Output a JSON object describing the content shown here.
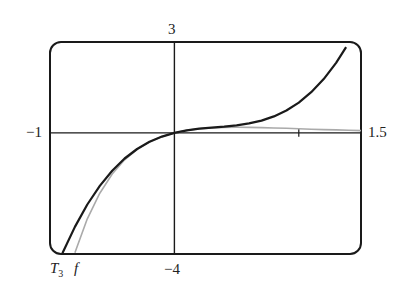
{
  "chart_data": {
    "type": "line",
    "title": "",
    "xlabel": "",
    "ylabel": "",
    "xlim": [
      -1,
      1.5
    ],
    "ylim": [
      -4,
      3
    ],
    "grid": false,
    "legend": "curve labels at bottom-left",
    "tick_labels": {
      "x_min": "−1",
      "x_max": "1.5",
      "y_max": "3",
      "y_min": "−4"
    },
    "x_ticks": [
      1
    ],
    "series": [
      {
        "name": "T3",
        "label": "T",
        "subscript": "3",
        "color": "#1a1a1a",
        "width": 2.2,
        "formula": "x - 2x^2 + 2x^3",
        "x": [
          -0.9,
          -0.8,
          -0.7,
          -0.6,
          -0.5,
          -0.4,
          -0.3,
          -0.2,
          -0.1,
          0,
          0.1,
          0.2,
          0.3,
          0.4,
          0.5,
          0.6,
          0.7,
          0.8,
          0.9,
          1.0,
          1.1,
          1.2,
          1.3,
          1.38
        ],
        "y": [
          -3.978,
          -3.104,
          -2.366,
          -1.752,
          -1.25,
          -0.848,
          -0.534,
          -0.296,
          -0.122,
          0,
          0.082,
          0.136,
          0.174,
          0.208,
          0.25,
          0.312,
          0.406,
          0.544,
          0.738,
          1.0,
          1.342,
          1.776,
          2.314,
          2.829
        ]
      },
      {
        "name": "f",
        "label": "f",
        "color": "#aaaaaa",
        "width": 1.6,
        "formula": "x e^{-2x}",
        "x": [
          -0.8,
          -0.7,
          -0.6,
          -0.5,
          -0.4,
          -0.3,
          -0.2,
          -0.1,
          0,
          0.1,
          0.2,
          0.3,
          0.4,
          0.5,
          0.6,
          0.7,
          0.8,
          0.9,
          1.0,
          1.1,
          1.2,
          1.3,
          1.4,
          1.5
        ],
        "y": [
          -3.962,
          -2.839,
          -1.992,
          -1.359,
          -0.89,
          -0.547,
          -0.298,
          -0.122,
          0,
          0.082,
          0.134,
          0.165,
          0.18,
          0.184,
          0.181,
          0.173,
          0.161,
          0.149,
          0.135,
          0.122,
          0.109,
          0.097,
          0.085,
          0.075
        ]
      }
    ]
  }
}
